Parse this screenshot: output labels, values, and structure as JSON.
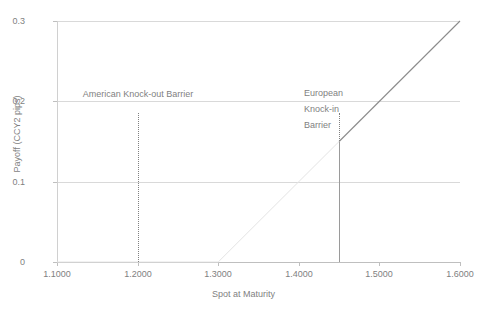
{
  "chart_data": {
    "type": "line",
    "title": "",
    "xlabel": "Spot at Maturity",
    "ylabel": "Payoff (CCY2 pips)",
    "xlim": [
      1.1,
      1.6
    ],
    "ylim": [
      0,
      0.3
    ],
    "grid": true,
    "legend": "none",
    "xticks": [
      "1.1000",
      "1.2000",
      "1.3000",
      "1.4000",
      "1.5000",
      "1.6000"
    ],
    "xtick_values": [
      1.1,
      1.2,
      1.3,
      1.4,
      1.5,
      1.6
    ],
    "yticks": [
      "0",
      "0.1",
      "0.2",
      "0.3"
    ],
    "ytick_values": [
      0,
      0.1,
      0.2,
      0.3
    ],
    "series": [
      {
        "name": "Vanilla payoff (pre-knock-in)",
        "color": "#e4e4e4",
        "x": [
          1.1,
          1.3,
          1.45
        ],
        "values": [
          0,
          0,
          0.15
        ]
      },
      {
        "name": "Knock-in payoff",
        "color": "#8c8c8c",
        "x": [
          1.45,
          1.6
        ],
        "values": [
          0.15,
          0.3
        ]
      }
    ],
    "annotations": [
      {
        "name": "american-knock-out-barrier",
        "label": "American Knock-out Barrier",
        "label_lines": [
          "American Knock-out Barrier"
        ],
        "x": 1.2,
        "line_style": "dotted",
        "line_top_value": 0.185,
        "line_bottom_value": 0.0
      },
      {
        "name": "european-knock-in-barrier",
        "label": "European Knock-in Barrier",
        "label_lines": [
          "European",
          "Knock-in",
          "Barrier"
        ],
        "x": 1.45,
        "line_style": "dotted-over-solid",
        "line_top_value": 0.185,
        "line_bottom_value": 0.0,
        "payoff_at_barrier": 0.15
      }
    ],
    "colors": {
      "gridline": "#d9d9d9",
      "axis": "#bfbfbf",
      "text": "#7f7f7f",
      "faint_series": "#e4e4e4",
      "main_series": "#8c8c8c",
      "background": "#ffffff"
    }
  },
  "ytick_labels": {
    "t0": "0.3",
    "t1": "0.2",
    "t2": "0.1",
    "t3": "0"
  },
  "xtick_labels": {
    "t0": "1.1000",
    "t1": "1.2000",
    "t2": "1.3000",
    "t3": "1.4000",
    "t4": "1.5000",
    "t5": "1.6000"
  },
  "axis_titles": {
    "x": "Spot at Maturity",
    "y": "Payoff (CCY2 pips)"
  },
  "annotation_text": {
    "american": "American Knock-out Barrier",
    "european_line1": "European",
    "european_line2": "Knock-in",
    "european_line3": "Barrier"
  }
}
